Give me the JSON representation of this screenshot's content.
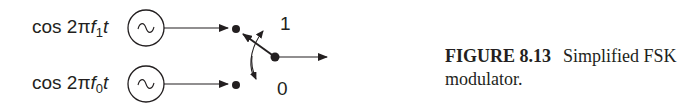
{
  "figure": {
    "signals": [
      {
        "prefix": "cos 2π",
        "f": "f",
        "sub": "1",
        "t": "t",
        "source_icon": "sine-wave-source"
      },
      {
        "prefix": "cos 2π",
        "f": "f",
        "sub": "0",
        "t": "t",
        "source_icon": "sine-wave-source"
      }
    ],
    "switch_positions": {
      "top": "1",
      "bottom": "0"
    },
    "caption": {
      "number": "FIGURE 8.13",
      "text": "Simplified FSK modulator."
    }
  }
}
